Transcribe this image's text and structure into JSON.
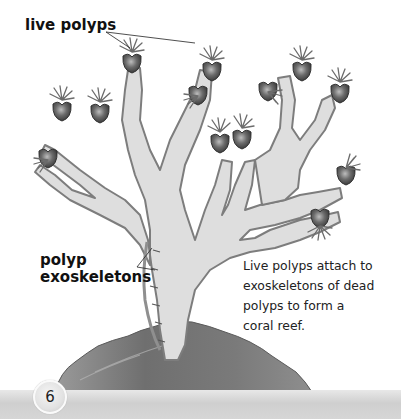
{
  "labels": {
    "live_polyps": "live polyps",
    "polyp_exoskeletons_line1": "polyp",
    "polyp_exoskeletons_line2": "exoskeletons"
  },
  "caption": {
    "line1": "Live polyps attach to",
    "line2": "exoskeletons of dead",
    "line3": "polyps to form a",
    "line4": "coral reef."
  },
  "footer": {
    "page_number": "6"
  },
  "illustration": {
    "subject": "branching coral with live polyps on exoskeletons of dead polyps",
    "colors": {
      "coral_body": "#dedede",
      "coral_edge": "#8a8a8a",
      "polyp_body": "#6a6a6a",
      "rock": "#7d7d7d",
      "background": "#ffffff"
    }
  }
}
